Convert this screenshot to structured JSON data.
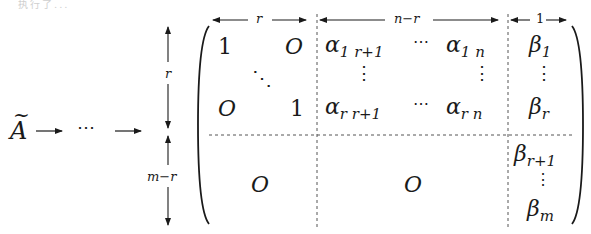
{
  "header_fragment": "执行了...",
  "left": {
    "matrix_symbol": "A",
    "tilde": "~",
    "ellipsis": "⋯"
  },
  "dimensions": {
    "top": [
      {
        "label": "r"
      },
      {
        "label": "n−r"
      },
      {
        "label": "1"
      }
    ],
    "side": [
      {
        "label": "r"
      },
      {
        "label": "m−r"
      }
    ]
  },
  "matrix": {
    "block_identity": {
      "top_left": "1",
      "top_right": "O",
      "diag_dots": "⋱",
      "bottom_left": "O",
      "bottom_right": "1"
    },
    "block_alpha": {
      "row1_first": {
        "base": "α",
        "sub": "1 r+1"
      },
      "row1_dots": "⋯",
      "row1_last": {
        "base": "α",
        "sub": "1 n"
      },
      "vdots": "⋮",
      "rowr_first": {
        "base": "α",
        "sub": "r r+1"
      },
      "rowr_dots": "⋯",
      "rowr_last": {
        "base": "α",
        "sub": "r n"
      }
    },
    "block_beta_top": {
      "first": {
        "base": "β",
        "sub": "1"
      },
      "vdots": "⋮",
      "last": {
        "base": "β",
        "sub": "r"
      }
    },
    "block_zero_left": "O",
    "block_zero_mid": "O",
    "block_beta_bottom": {
      "first": {
        "base": "β",
        "sub": "r+1"
      },
      "vdots": "⋮",
      "last": {
        "base": "β",
        "sub": "m"
      }
    }
  },
  "colors": {
    "ink": "#1a1a1a",
    "dash": "#555555",
    "background": "#ffffff"
  }
}
